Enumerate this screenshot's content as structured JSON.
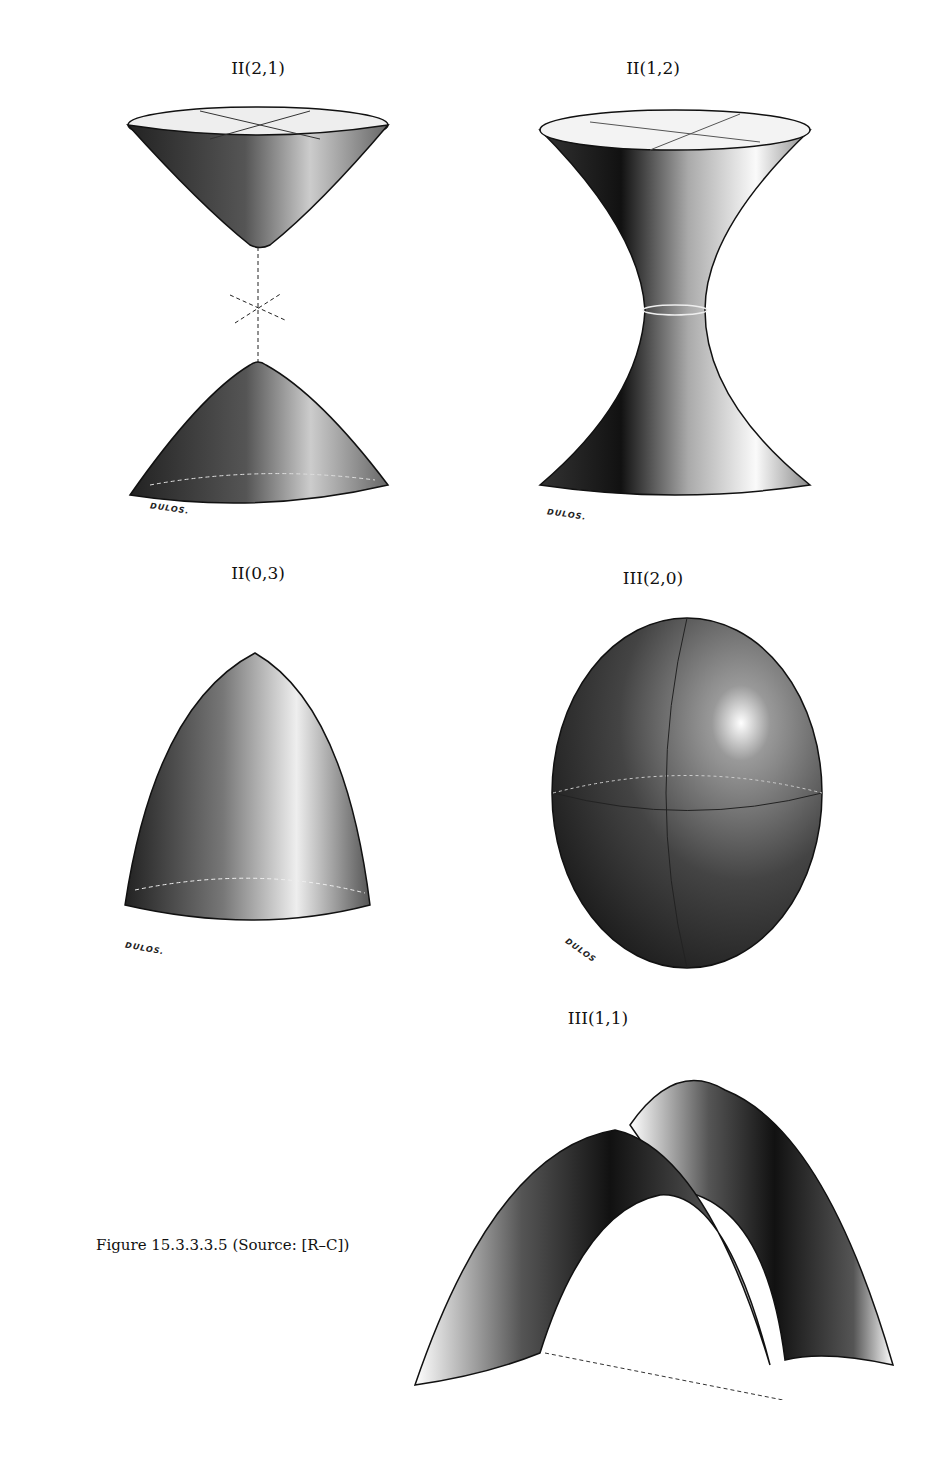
{
  "figures": [
    {
      "label": "II(2,1)",
      "signature": "DULOS.",
      "shape": "hyperboloid of two sheets"
    },
    {
      "label": "II(1,2)",
      "signature": "DULOS.",
      "shape": "hyperboloid of one sheet"
    },
    {
      "label": "II(0,3)",
      "signature": "DULOS.",
      "shape": "elliptic paraboloid"
    },
    {
      "label": "III(2,0)",
      "signature": "DULOS",
      "shape": "ellipsoid"
    },
    {
      "label": "III(1,1)",
      "signature": "",
      "shape": "hyperbolic paraboloid"
    }
  ],
  "caption": "Figure 15.3.3.3.5 (Source: [R–C])"
}
